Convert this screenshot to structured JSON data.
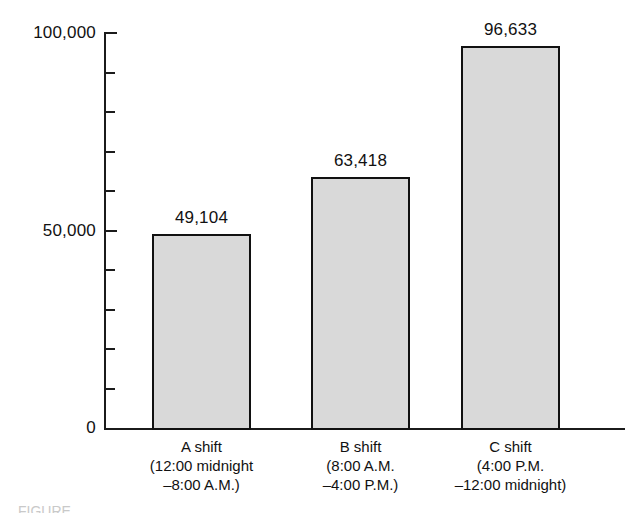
{
  "chart_data": {
    "type": "bar",
    "title": "",
    "subtitle": "",
    "xlabel": "",
    "ylabel": "",
    "ylim": [
      0,
      100000
    ],
    "grid": false,
    "legend": false,
    "categories": [
      "A shift",
      "B shift",
      "C shift"
    ],
    "category_sublabels": [
      [
        "(12:00 midnight",
        "–8:00 A.M.)"
      ],
      [
        "(8:00 A.M.",
        "–4:00 P.M.)"
      ],
      [
        "(4:00 P.M.",
        "–12:00 midnight)"
      ]
    ],
    "values": [
      49104,
      63418,
      96633
    ],
    "value_labels": [
      "49,104",
      "63,418",
      "96,633"
    ],
    "y_tick_values": [
      0,
      10000,
      20000,
      30000,
      40000,
      50000,
      60000,
      70000,
      80000,
      90000,
      100000
    ],
    "y_labeled_ticks": [
      {
        "value": 100000,
        "label": "100,000"
      },
      {
        "value": 50000,
        "label": "50,000"
      },
      {
        "value": 0,
        "label": "0"
      }
    ],
    "colors": {
      "bar_fill": "#d9d9d9",
      "bar_border": "#111111",
      "axis": "#1b1b1b",
      "text": "#111111",
      "background": "#ffffff"
    }
  },
  "caption_sliver": "FIGURE"
}
